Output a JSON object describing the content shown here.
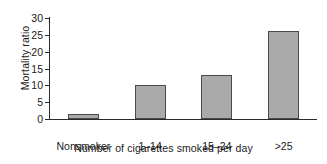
{
  "chart_data": {
    "type": "bar",
    "title": "",
    "xlabel": "Number of cigarettes smoked per day",
    "ylabel": "Mortality ratio",
    "categories": [
      "Nonsmoker",
      "1–14",
      "15–24",
      ">25"
    ],
    "values": [
      1.5,
      10,
      13,
      26
    ],
    "ylim": [
      0,
      30
    ],
    "yticks": [
      0,
      5,
      10,
      15,
      20,
      25,
      30
    ],
    "ytick_labels": [
      "0",
      "5",
      "10",
      "15",
      "20",
      "25",
      "30"
    ],
    "grid": false,
    "legend": null,
    "bar_color": "#aaaaaa",
    "bar_edge_color": "#4a4a4a",
    "axis_color": "#2b2b2b",
    "background": "#ffffff"
  }
}
